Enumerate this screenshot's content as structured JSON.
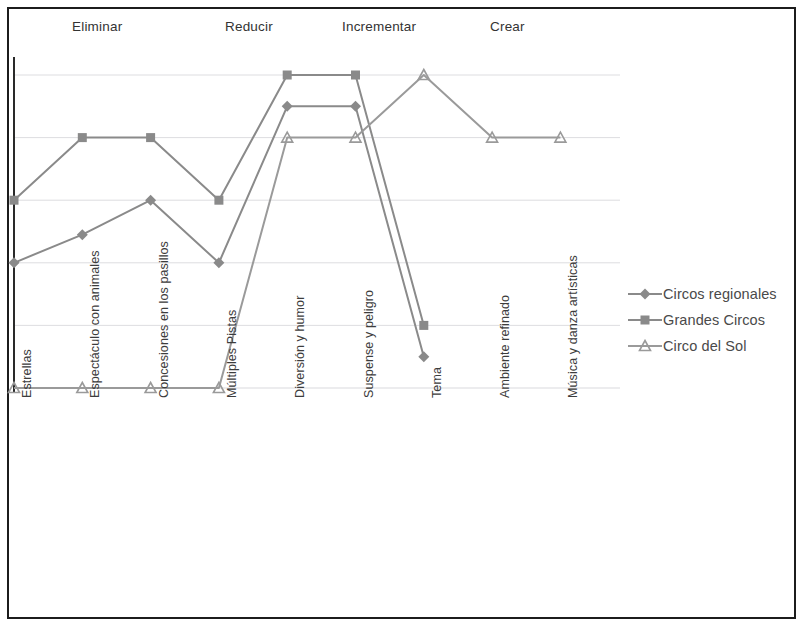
{
  "frame": {
    "border_color": "#1c1c1c"
  },
  "phases": [
    {
      "label": "Eliminar",
      "x": 72
    },
    {
      "label": "Reducir",
      "x": 225
    },
    {
      "label": "Incrementar",
      "x": 342
    },
    {
      "label": "Crear",
      "x": 490
    }
  ],
  "legend": {
    "items": [
      {
        "label": "Circos regionales",
        "marker": "diamond",
        "color": "#8a8a8a"
      },
      {
        "label": "Grandes Circos",
        "marker": "square",
        "color": "#8a8a8a"
      },
      {
        "label": "Circo del Sol",
        "marker": "triangle",
        "color": "#9a9a9a"
      }
    ]
  },
  "chart_data": {
    "type": "line",
    "title": "",
    "xlabel": "",
    "ylabel": "",
    "grid": true,
    "legend_position": "right",
    "ylim": [
      0,
      5
    ],
    "gridlines": [
      0,
      1,
      2,
      3,
      4,
      5
    ],
    "categories": [
      "Estrellas",
      "Espectáculo con animales",
      "Concesiones en los pasillos",
      "Múltiples Pistas",
      "Diversión y humor",
      "Suspense y peligro",
      "Tema",
      "Ambiente refinado",
      "Música y danza artísticas"
    ],
    "series": [
      {
        "name": "Circos regionales",
        "marker": "diamond",
        "values": [
          2,
          2.45,
          3,
          2,
          4.5,
          4.5,
          0.5,
          null,
          null
        ]
      },
      {
        "name": "Grandes Circos",
        "marker": "square",
        "values": [
          3,
          4,
          4,
          3,
          5,
          5,
          1,
          null,
          null
        ]
      },
      {
        "name": "Circo del Sol",
        "marker": "triangle",
        "values": [
          0,
          0,
          0,
          0,
          4,
          4,
          5,
          4,
          4
        ]
      }
    ]
  }
}
